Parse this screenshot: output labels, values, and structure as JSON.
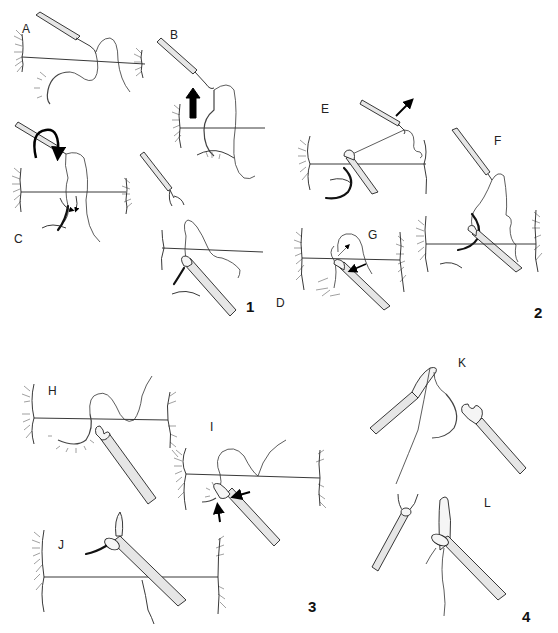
{
  "figure": {
    "panels": [
      {
        "number": "1",
        "steps": [
          {
            "label": "A"
          },
          {
            "label": "B"
          },
          {
            "label": "C"
          },
          {
            "label": "D"
          }
        ]
      },
      {
        "number": "2",
        "steps": [
          {
            "label": "E"
          },
          {
            "label": "F"
          },
          {
            "label": "G"
          }
        ]
      },
      {
        "number": "3",
        "steps": [
          {
            "label": "H"
          },
          {
            "label": "I"
          },
          {
            "label": "J"
          }
        ]
      },
      {
        "number": "4",
        "steps": [
          {
            "label": "K"
          },
          {
            "label": "L"
          }
        ]
      }
    ],
    "colors": {
      "line": "#222222",
      "background": "#ffffff",
      "instrument_fill": "#e6e6e6"
    },
    "icons": [
      "curved-arrow-icon",
      "straight-arrow-icon",
      "needle-holder-icon",
      "curved-needle-icon"
    ]
  }
}
